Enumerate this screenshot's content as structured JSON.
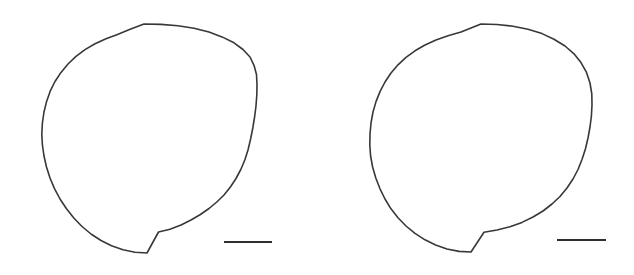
{
  "figure": {
    "background_color": "#ffffff",
    "stroke_color": "#383838",
    "scalebar_color": "#2e2e2e",
    "width": 634,
    "height": 275,
    "title": "",
    "caption": ""
  },
  "panels": [
    {
      "id": "panel-left",
      "label": "",
      "shape": "circle-outline",
      "center_x": 144,
      "center_y": 138,
      "radius_x": 113,
      "radius_y": 114,
      "fill": "#ffffff",
      "stroke": "#383838",
      "stroke_width": 1.6,
      "outline_points": "144,24 161,24.4 178,25.8 194,28.3 209,32.0 222,36.9 234,42.8 243,49.5 250,57.0 254,65.3 256.5,74.5 257,84.5 256.8,95 256,106 254.6,117 252.8,128 250.6,139 248,150 244.8,160 240.8,169.5 236,178.5 230.4,187 224,195 216.8,202 209,208.5 200.4,214.5 191,220 181,225 170,229.2 158.5,232 147,253 135,252.3 123,249.8 111.5,245.8 101,240.5 91,234 82,226.5 73.8,218 66.5,208.8 60,199 54.5,188.6 50,178 46.5,167 44,156 42.4,145 41.8,134 42.4,123 44,112 46.6,101.4 50.2,91.2 55,81.5 61,72.4 68,64 76,56.4 85,49.6 95,43.8 106,38.8 117.5,34.4 129.5,29.6 144,24",
      "scale_bar": {
        "x1": 224,
        "x2": 272,
        "y": 242,
        "length_px": 48,
        "label": ""
      }
    },
    {
      "id": "panel-right",
      "label": "",
      "shape": "circle-outline",
      "center_x": 481,
      "center_y": 138,
      "radius_x": 111,
      "radius_y": 114,
      "fill": "#ffffff",
      "stroke": "#383838",
      "stroke_width": 1.6,
      "outline_points": "481,24 497,24.5 513,26.2 528,29.2 542,33.6 554,39.2 565,46 574,53.8 581,62.6 586.5,72.4 590,83 591.8,94 592,105 591.4,116 590,127 588,138 585.4,149 582,159.5 578,169.5 573,179 567,188 560,196.5 552,204 543,211 533,217 522,222.4 510,226.8 497,230 484,232.2 471,252 459,251.4 447,249 435.6,245 425,239.8 415,233.4 406,226 398,217.8 391,208.8 385,199 380,188.8 375.8,178 372.6,167 370.6,156 369.8,145 370,134 371,123 373,112 376,101.6 380,91.6 385,82 391,73 398,64.8 406,57.4 415,50.8 425,45 436,40 448,35.8 461,32 481,24",
      "scale_bar": {
        "x1": 557,
        "x2": 606,
        "y": 240,
        "length_px": 49,
        "label": ""
      }
    }
  ],
  "chart_data": {
    "type": "scatter",
    "title": "",
    "xlabel": "",
    "ylabel": "",
    "categories": [
      "panel-left",
      "panel-right"
    ],
    "series": [
      {
        "name": "outline-diameter-px",
        "values": [
          226,
          222
        ]
      },
      {
        "name": "scale-bar-length-px",
        "values": [
          48,
          49
        ]
      }
    ],
    "legend": [],
    "grid": false
  }
}
